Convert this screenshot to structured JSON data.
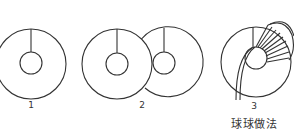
{
  "figure": {
    "title": "球球做法",
    "steps": [
      {
        "label": "1",
        "description": "single cardboard ring with slit"
      },
      {
        "label": "2",
        "description": "two overlapping cardboard rings"
      },
      {
        "label": "3",
        "description": "yarn wrapped around ring"
      }
    ],
    "stroke_color": "#333333"
  }
}
